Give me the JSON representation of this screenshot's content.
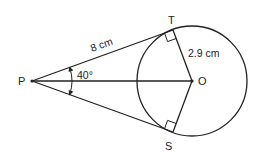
{
  "diagram": {
    "type": "geometry",
    "points": {
      "P": {
        "label": "P",
        "x": 32,
        "y": 81
      },
      "O": {
        "label": "O",
        "x": 192,
        "y": 81
      },
      "T": {
        "label": "T",
        "x": 173,
        "y": 30
      },
      "S": {
        "label": "S",
        "x": 173,
        "y": 132
      }
    },
    "circle": {
      "center": "O",
      "radius_px": 55
    },
    "measurements": {
      "PT": "8 cm",
      "OT": "2.9 cm",
      "angle_TPS": "40°"
    },
    "right_angles": [
      "OTP",
      "OSP"
    ],
    "colors": {
      "stroke": "#222222",
      "background": "#ffffff"
    }
  }
}
